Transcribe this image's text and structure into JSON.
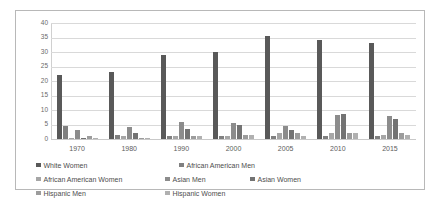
{
  "chart_data": {
    "type": "bar",
    "title": "",
    "subtitle": "",
    "xlabel": "",
    "ylabel": "",
    "ylim": [
      0,
      40
    ],
    "y_ticks": [
      0,
      5,
      10,
      15,
      20,
      25,
      30,
      35,
      40
    ],
    "grid": true,
    "legend_position": "bottom",
    "categories": [
      "1970",
      "1980",
      "1990",
      "2000",
      "2005",
      "2010",
      "2015"
    ],
    "series": [
      {
        "name": "White Women",
        "color": "#595959",
        "values": [
          22,
          23,
          29,
          30,
          35.5,
          34,
          33
        ]
      },
      {
        "name": "African American Men",
        "color": "#808080",
        "values": [
          4.5,
          1.5,
          1,
          1,
          1,
          1,
          1
        ]
      },
      {
        "name": "African American Women",
        "color": "#a6a6a6",
        "values": [
          0.5,
          1,
          1,
          1,
          2,
          2,
          1.5
        ]
      },
      {
        "name": "Asian Men",
        "color": "#8c8c8c",
        "values": [
          3,
          4.2,
          6,
          5.5,
          4.5,
          8.2,
          8
        ]
      },
      {
        "name": "Asian Women",
        "color": "#737373",
        "values": [
          0.5,
          2,
          3.5,
          5,
          3,
          8.5,
          6.8
        ]
      },
      {
        "name": "Hispanic Men",
        "color": "#9c9c9c",
        "values": [
          1,
          0.5,
          1,
          1.5,
          2,
          2,
          2
        ]
      },
      {
        "name": "Hispanic Women",
        "color": "#b0b0b0",
        "values": [
          0.2,
          0.5,
          1,
          1.5,
          1,
          2,
          1.5
        ]
      }
    ]
  },
  "legend": {
    "items": [
      {
        "label": "White Women"
      },
      {
        "label": "African American Men"
      },
      {
        "label": "African American Women"
      },
      {
        "label": "Asian Men"
      },
      {
        "label": "Asian Women"
      },
      {
        "label": "Hispanic Men"
      },
      {
        "label": "Hispanic Women"
      }
    ]
  },
  "colors": {
    "frame_border": "#b8b8b8",
    "gridline": "#d9d9d9",
    "tick_text": "#6a6a6a",
    "legend_text": "#4d4d4d",
    "background": "#ffffff"
  }
}
